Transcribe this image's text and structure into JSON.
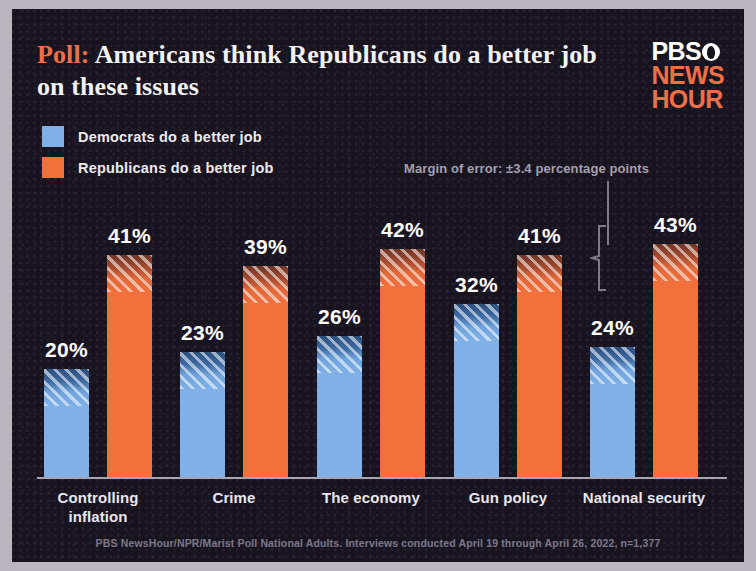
{
  "headline": {
    "kicker": "Poll:",
    "text": " Americans think Republicans do a better job on these issues"
  },
  "logo": {
    "line1": "PBS",
    "line2": "NEWS",
    "line3": "HOUR",
    "mark": "pbs-head-icon"
  },
  "legend": {
    "items": [
      {
        "label": "Democrats do a better job",
        "color": "#7fb0e8"
      },
      {
        "label": "Republicans do a better job",
        "color": "#f2703c"
      }
    ]
  },
  "annotation": {
    "margin_of_error": "Margin of error: ±3.4 percentage points"
  },
  "source": "PBS NewsHour/NPR/Marist Poll National Adults. Interviews conducted April 19 through April 26, 2022,  n=1,377",
  "chart_data": {
    "type": "bar",
    "title": "Poll: Americans think Republicans do a better job on these issues",
    "xlabel": "",
    "ylabel": "",
    "ylim": [
      0,
      50
    ],
    "grid": false,
    "legend_position": "top-left",
    "categories": [
      "Controlling inflation",
      "Crime",
      "The economy",
      "Gun policy",
      "National security"
    ],
    "series": [
      {
        "name": "Democrats do a better job",
        "color": "#7fb0e8",
        "values": [
          20,
          23,
          26,
          32,
          24
        ]
      },
      {
        "name": "Republicans do a better job",
        "color": "#f2703c",
        "values": [
          41,
          39,
          42,
          41,
          43
        ]
      }
    ],
    "value_labels": [
      "20%",
      "41%",
      "23%",
      "39%",
      "26%",
      "42%",
      "32%",
      "41%",
      "24%",
      "43%"
    ],
    "error_margin": 3.4,
    "annotation": "Margin of error: ±3.4 percentage points"
  }
}
